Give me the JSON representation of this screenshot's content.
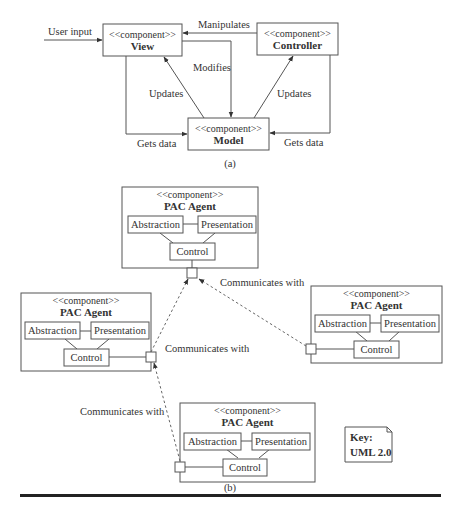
{
  "figure_a": {
    "label": "(a)",
    "stereotype": "<<component>>",
    "components": {
      "view": "View",
      "controller": "Controller",
      "model": "Model"
    },
    "edges": {
      "user_input": "User input",
      "manipulates": "Manipulates",
      "modifies": "Modifies",
      "updates_left": "Updates",
      "updates_right": "Updates",
      "gets_data_left": "Gets data",
      "gets_data_right": "Gets data"
    }
  },
  "figure_b": {
    "label": "(b)",
    "stereotype": "<<component>>",
    "agent_name": "PAC Agent",
    "parts": {
      "abstraction": "Abstraction",
      "presentation": "Presentation",
      "control": "Control"
    },
    "edges": {
      "communicates_top_right": "Communicates with",
      "communicates_middle": "Communicates with",
      "communicates_bottom_left": "Communicates with"
    }
  },
  "key": {
    "title": "Key:",
    "value": "UML  2.0"
  }
}
